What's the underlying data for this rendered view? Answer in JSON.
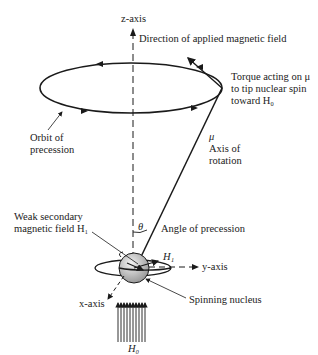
{
  "diagram": {
    "type": "nuclear-spin-precession",
    "labels": {
      "z_axis": "z-axis",
      "applied_field": "Direction of applied magnetic field",
      "torque_line1": "Torque acting on μ",
      "torque_line2": "to tip nuclear spin",
      "torque_line3": "toward H₀",
      "orbit_line1": "Orbit of",
      "orbit_line2": "precession",
      "mu": "μ",
      "axis_line1": "Axis of",
      "axis_line2": "rotation",
      "weak_line1": "Weak secondary",
      "weak_line2": "magnetic field H₁",
      "theta": "θ",
      "angle": "Angle of precession",
      "h1": "H₁",
      "y_axis": "y-axis",
      "x_axis": "x-axis",
      "spinning": "Spinning nucleus",
      "h0": "H₀"
    },
    "colors": {
      "ink": "#1a1a1a",
      "background": "#ffffff",
      "sphere": "#cfcfcf"
    }
  }
}
